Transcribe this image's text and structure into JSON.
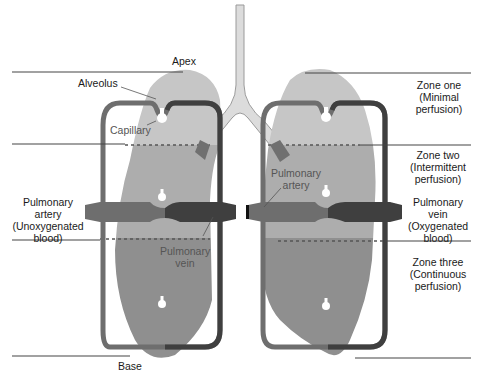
{
  "colors": {
    "lung_light": "#c6c6c6",
    "lung_dark": "#8f8f8f",
    "vessel_artery": "#6e6e6e",
    "vessel_vein": "#3f3f3f",
    "trachea": "#dcdcdc",
    "trachea_outline": "#9a9a9a",
    "zone_line": "#444444",
    "background": "#ffffff"
  },
  "labels": {
    "apex": "Apex",
    "base": "Base",
    "alveolus": "Alveolus",
    "capillary": "Capillary",
    "pulmonary_artery_left": [
      "Pulmonary",
      "artery",
      "(Unoxygenated",
      "blood)"
    ],
    "pulmonary_vein_center": [
      "Pulmonary",
      "vein"
    ],
    "pulmonary_artery_center": [
      "Pulmonary",
      "artery"
    ],
    "pulmonary_vein_right": [
      "Pulmonary",
      "vein",
      "(Oxygenated",
      "blood)"
    ]
  },
  "zones": [
    {
      "name": "Zone one",
      "description": "(Minimal",
      "description2": "perfusion)"
    },
    {
      "name": "Zone two",
      "description": "(Intermittent",
      "description2": "perfusion)"
    },
    {
      "name": "Zone three",
      "description": "(Continuous",
      "description2": "perfusion)"
    }
  ]
}
